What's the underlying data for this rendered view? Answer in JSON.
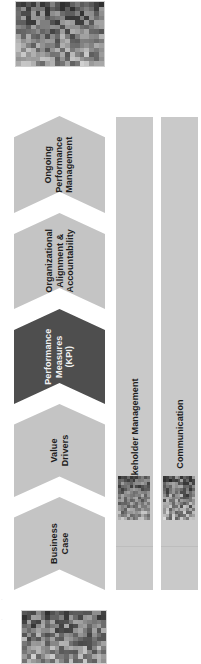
{
  "diagram": {
    "orientation": "rotated-90",
    "process": {
      "name": "performance-management-process",
      "steps": [
        {
          "id": "business-case",
          "label": "Business\nCase",
          "emphasis": "light",
          "top": 497,
          "height": 93
        },
        {
          "id": "value-drivers",
          "label": "Value\nDrivers",
          "emphasis": "light",
          "top": 404,
          "height": 93
        },
        {
          "id": "performance-measures-kpi",
          "label": "Performance\nMeasures\n(KPI)",
          "emphasis": "dark",
          "top": 309,
          "height": 95
        },
        {
          "id": "organizational-alignment",
          "label": "Organizational\nAlignment &\nAccountability",
          "emphasis": "light",
          "top": 213,
          "height": 96
        },
        {
          "id": "ongoing-performance-mgmt",
          "label": "Ongoing\nPerformance\nManagement",
          "emphasis": "light",
          "top": 116,
          "height": 97
        }
      ]
    },
    "support_lanes": [
      {
        "id": "stakeholder-management",
        "label": "Stakeholder Management"
      },
      {
        "id": "communication",
        "label": "Communication"
      }
    ],
    "images": [
      {
        "id": "photo-top",
        "alt": "city skyline photograph"
      },
      {
        "id": "photo-bottom",
        "alt": "people at a table photograph"
      },
      {
        "id": "photo-lane-1",
        "alt": "meeting photograph"
      },
      {
        "id": "photo-lane-2",
        "alt": "hand writing photograph"
      }
    ]
  },
  "colors": {
    "chevron_light": "#c4c4c4",
    "chevron_dark": "#4e4e4e",
    "lane": "#c9c9c9",
    "text_dark": "#1d1d1d",
    "text_light": "#f2f2f2",
    "background": "#ffffff"
  }
}
